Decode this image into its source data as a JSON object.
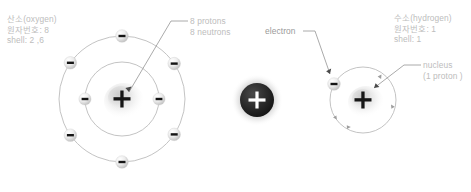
{
  "diagram": {
    "background_color": "#ffffff",
    "text_color": "#bdbdbd",
    "particle_color": "#1a1a1a",
    "orbit_color": "#b0b0b0"
  },
  "labels": {
    "oxygen_block": {
      "line1": "산소(oxygen)",
      "line2": "원자번호: 8",
      "line3": "shell: 2 ,6"
    },
    "oxygen_nucleus": {
      "line1": "8 protons",
      "line2": "8 neutrons"
    },
    "electron": "electron",
    "hydrogen_block": {
      "line1": "수소(hydrogen)",
      "line2": "원자번호: 1",
      "line3": "shell: 1"
    },
    "hydrogen_nucleus": {
      "line1": "nucleus",
      "line2": "(1 proton )"
    }
  },
  "atoms": {
    "oxygen": {
      "name": "oxygen",
      "atomic_number": 8,
      "protons": 8,
      "neutrons": 8,
      "shells": [
        2,
        6
      ],
      "nucleus_symbol": "+",
      "electron_symbol": "−",
      "center": {
        "x": 122,
        "y": 99
      },
      "inner_shell_radius": 37,
      "outer_shell_radius": 63,
      "inner_electron_angles": [
        180,
        0
      ],
      "outer_electron_angles": [
        270,
        215,
        325,
        145,
        35,
        90
      ]
    },
    "hydrogen": {
      "name": "hydrogen",
      "atomic_number": 1,
      "protons": 1,
      "shells": [
        1
      ],
      "nucleus_symbol": "+",
      "electron_symbol": "−",
      "center": {
        "x": 363,
        "y": 100
      },
      "shell_radius": 33,
      "electron_angles": [
        208
      ]
    },
    "free_proton": {
      "symbol": "+",
      "center": {
        "x": 257,
        "y": 100
      },
      "radius": 17
    }
  }
}
